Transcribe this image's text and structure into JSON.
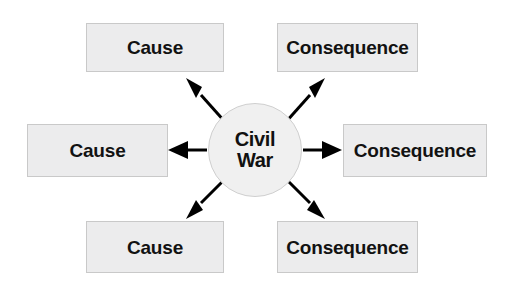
{
  "diagram": {
    "type": "cause-and-consequence-web",
    "background_color": "#ffffff",
    "center": {
      "name": "civil-war",
      "line1": "Civil",
      "line2": "War",
      "shape": "circle",
      "fill_color": "#f0f0f0",
      "border_color": "#cfcfcf"
    },
    "node_style": {
      "fill_color": "#ececed",
      "border_color": "#c9c9c9",
      "text_color": "#121212"
    },
    "arrow_color": "#000000",
    "nodes": [
      {
        "name": "cause-top",
        "label": "Cause",
        "position": "top-left",
        "arrow_direction": "up-left"
      },
      {
        "name": "consequence-top",
        "label": "Consequence",
        "position": "top-right",
        "arrow_direction": "up-right"
      },
      {
        "name": "cause-middle",
        "label": "Cause",
        "position": "middle-left",
        "arrow_direction": "left"
      },
      {
        "name": "consequence-middle",
        "label": "Consequence",
        "position": "middle-right",
        "arrow_direction": "right"
      },
      {
        "name": "cause-bottom",
        "label": "Cause",
        "position": "bottom-left",
        "arrow_direction": "down-left"
      },
      {
        "name": "consequence-bottom",
        "label": "Consequence",
        "position": "bottom-right",
        "arrow_direction": "down-right"
      }
    ]
  }
}
